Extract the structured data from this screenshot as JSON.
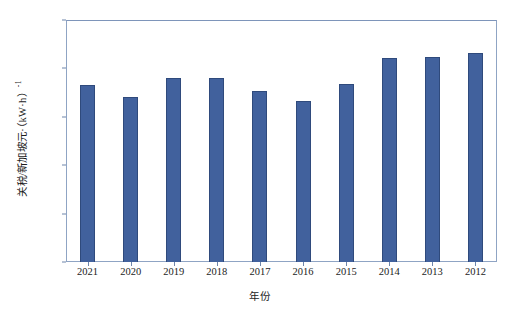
{
  "chart_data": {
    "type": "bar",
    "title": "",
    "xlabel": "年份",
    "ylabel_text": "关税/新加坡元·（kW·h）",
    "ylabel_superscript": "-1",
    "categories": [
      "2021",
      "2020",
      "2019",
      "2018",
      "2017",
      "2016",
      "2015",
      "2014",
      "2013",
      "2012"
    ],
    "values": [
      18.3,
      17.0,
      19.0,
      19.0,
      17.7,
      16.6,
      18.4,
      21.1,
      21.2,
      21.6
    ],
    "ylim": [
      0,
      25
    ],
    "yticks": [
      "0",
      "5",
      "10",
      "15",
      "20",
      "25"
    ],
    "ytick_values": [
      0,
      5,
      10,
      15,
      20,
      25
    ],
    "grid": false,
    "legend": "none",
    "series": [
      {
        "name": "关税",
        "values": [
          18.3,
          17.0,
          19.0,
          19.0,
          17.7,
          16.6,
          18.4,
          21.1,
          21.2,
          21.6
        ]
      }
    ],
    "colors": {
      "bar_fill": "#41619d",
      "bar_border": "#2f4a7c",
      "frame": "#8fa4c4",
      "text": "#1c1c1c",
      "background": "#ffffff"
    }
  }
}
